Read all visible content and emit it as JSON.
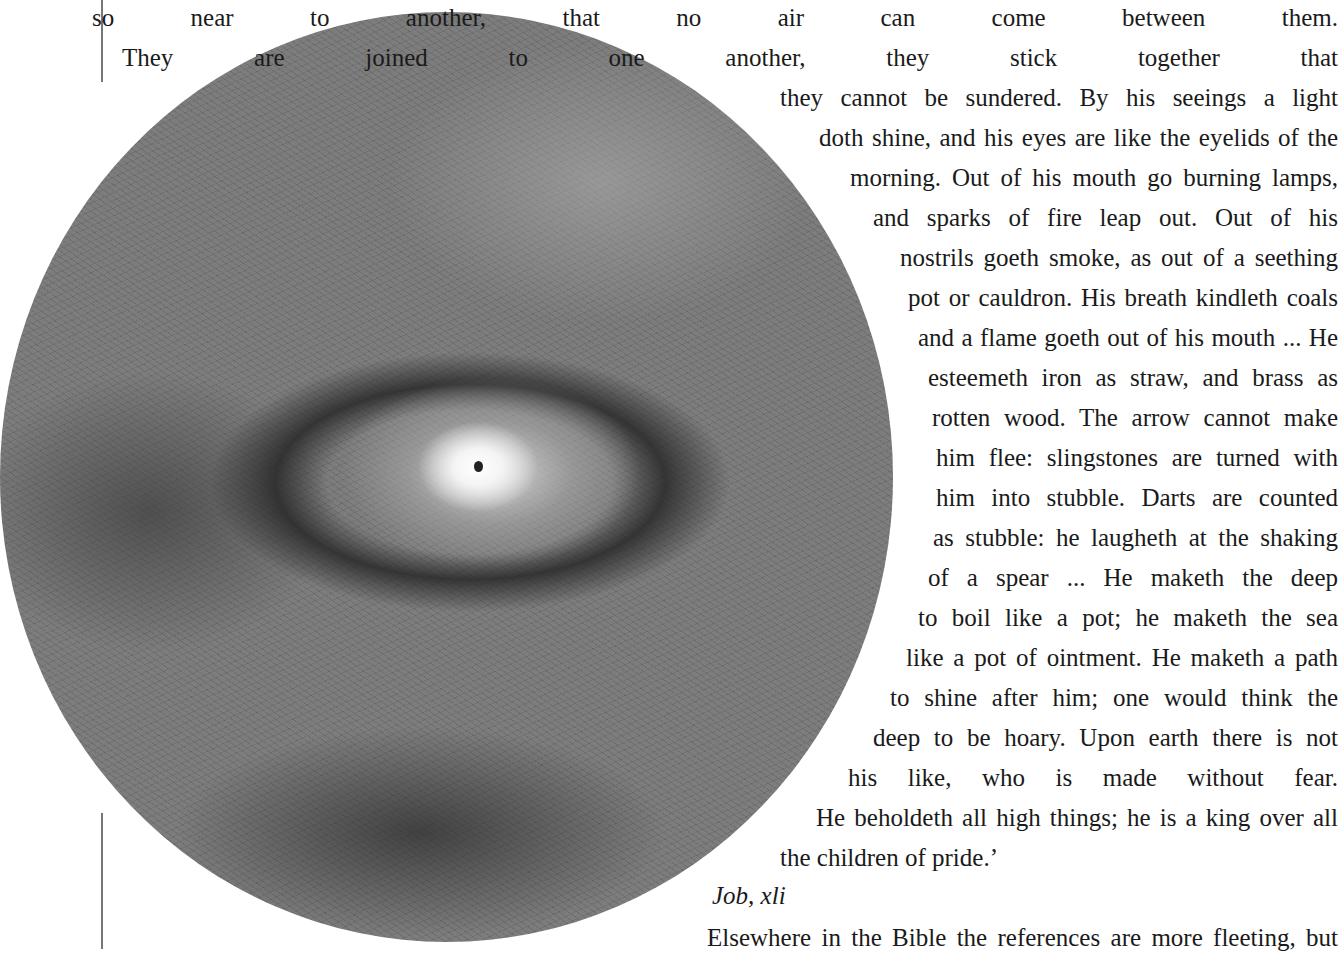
{
  "page": {
    "illustration": {
      "subject": "leviathan-eye-drawing",
      "description": "Circular graphite drawing of a glowing eye amid dark swirling strokes"
    },
    "quote_lines": [
      "so near to another, that no air can come between them.",
      "They are joined to one another, they stick together that",
      "they cannot be sundered. By his seeings a light",
      "doth shine, and his eyes are like the eyelids of the",
      "morning. Out of his mouth go burning lamps,",
      "and sparks of fire leap out. Out of his",
      "nostrils goeth smoke, as out of a seething",
      "pot or cauldron. His breath kindleth coals",
      "and a flame goeth out of his mouth ... He",
      "esteemeth iron as straw, and brass as",
      "rotten wood. The arrow cannot make",
      "him flee: slingstones are turned with",
      "him into stubble. Darts are counted",
      "as stubble: he laugheth at the shaking",
      "of a spear ... He maketh the deep",
      "to boil like a pot; he maketh the sea",
      "like a pot of ointment. He maketh a path",
      "to shine after him; one would think the",
      "deep to be hoary. Upon earth there is not",
      "his like, who is made without fear.",
      "He beholdeth all high things; he is a king over all",
      "the children of pride.’"
    ],
    "citation": "Job, xli",
    "following_text": "Elsewhere in the Bible the references are more fleeting, but"
  }
}
